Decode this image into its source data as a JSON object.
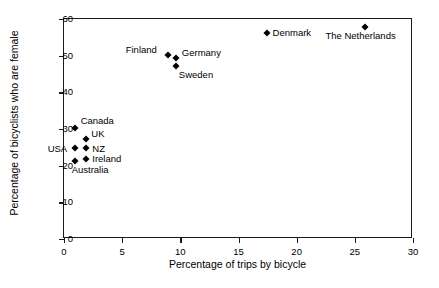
{
  "chart_data": {
    "type": "scatter",
    "title": "",
    "xlabel": "Percentage of trips by bicycle",
    "ylabel": "Percentage of bicyclists who are female",
    "xlim": [
      0,
      30
    ],
    "ylim": [
      0,
      60
    ],
    "xticks": [
      0,
      5,
      10,
      15,
      20,
      25,
      30
    ],
    "yticks": [
      0,
      10,
      20,
      30,
      40,
      50,
      60
    ],
    "grid": false,
    "legend": "none",
    "points": [
      {
        "label": "Canada",
        "x": 1.0,
        "y": 30.0,
        "label_dx": 6,
        "label_dy": -13
      },
      {
        "label": "UK",
        "x": 2.0,
        "y": 27.0,
        "label_dx": 5,
        "label_dy": -11
      },
      {
        "label": "USA",
        "x": 1.0,
        "y": 24.5,
        "label_dx": -27,
        "label_dy": -5
      },
      {
        "label": "NZ",
        "x": 2.0,
        "y": 24.5,
        "label_dx": 6,
        "label_dy": -5
      },
      {
        "label": "Australia",
        "x": 1.0,
        "y": 21.0,
        "label_dx": -3,
        "label_dy": 3
      },
      {
        "label": "Ireland",
        "x": 2.0,
        "y": 21.5,
        "label_dx": 6,
        "label_dy": -6
      },
      {
        "label": "Finland",
        "x": 9.0,
        "y": 50.0,
        "label_dx": -42,
        "label_dy": -11
      },
      {
        "label": "Germany",
        "x": 9.7,
        "y": 49.0,
        "label_dx": 6,
        "label_dy": -11
      },
      {
        "label": "Sweden",
        "x": 9.7,
        "y": 47.0,
        "label_dx": 3,
        "label_dy": 3
      },
      {
        "label": "Denmark",
        "x": 17.5,
        "y": 56.0,
        "label_dx": 6,
        "label_dy": -6
      },
      {
        "label": "The Netherlands",
        "x": 26.0,
        "y": 57.5,
        "label_dx": -40,
        "label_dy": 3
      }
    ]
  }
}
